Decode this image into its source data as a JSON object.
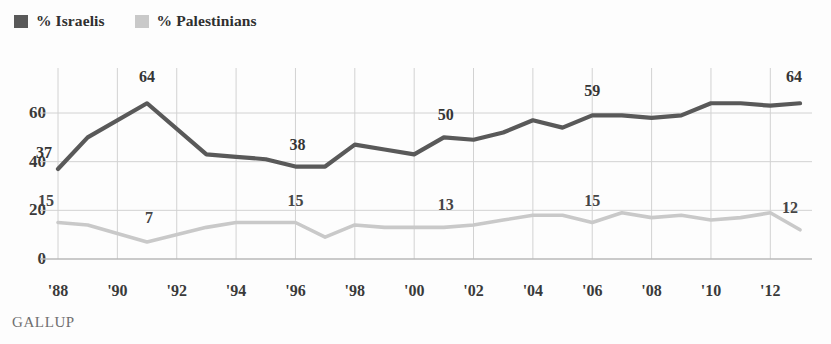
{
  "legend": {
    "items": [
      {
        "label": "% Israelis",
        "color": "#595959",
        "icon": "legend-swatch-israelis"
      },
      {
        "label": "% Palestinians",
        "color": "#c9c9c9",
        "icon": "legend-swatch-palestinians"
      }
    ]
  },
  "footer": {
    "source": "GALLUP"
  },
  "chart_data": {
    "type": "line",
    "title": "",
    "subtitle": "",
    "xlabel": "",
    "ylabel": "",
    "xlim": [
      1988,
      2013
    ],
    "ylim": [
      0,
      72
    ],
    "grid": true,
    "legend_position": "top-left",
    "y_ticks": [
      0,
      20,
      40,
      60
    ],
    "y_tick_labels": [
      "0",
      "20",
      "40",
      "60"
    ],
    "x_ticks": [
      1988,
      1990,
      1992,
      1994,
      1996,
      1998,
      2000,
      2002,
      2004,
      2006,
      2008,
      2010,
      2012
    ],
    "x_tick_labels": [
      "'88",
      "'90",
      "'92",
      "'94",
      "'96",
      "'98",
      "'00",
      "'02",
      "'04",
      "'06",
      "'08",
      "'10",
      "'12"
    ],
    "x": [
      1988,
      1989,
      1991,
      1993,
      1994,
      1995,
      1996,
      1997,
      1998,
      1999,
      2000,
      2001,
      2002,
      2003,
      2004,
      2005,
      2006,
      2007,
      2008,
      2009,
      2010,
      2011,
      2012,
      2013
    ],
    "series": [
      {
        "name": "% Israelis",
        "color": "#595959",
        "values": [
          37,
          50,
          64,
          43,
          42,
          41,
          38,
          38,
          47,
          45,
          43,
          50,
          49,
          52,
          57,
          54,
          59,
          59,
          58,
          59,
          64,
          64,
          63,
          64
        ]
      },
      {
        "name": "% Palestinians",
        "color": "#c9c9c9",
        "values": [
          15,
          14,
          7,
          13,
          15,
          15,
          15,
          9,
          14,
          13,
          13,
          13,
          14,
          16,
          18,
          18,
          15,
          19,
          17,
          18,
          16,
          17,
          19,
          12
        ]
      }
    ],
    "annotations": [
      {
        "series": "% Israelis",
        "x": 1988,
        "value": 37,
        "text": "37"
      },
      {
        "series": "% Israelis",
        "x": 1991,
        "value": 64,
        "text": "64"
      },
      {
        "series": "% Israelis",
        "x": 1996,
        "value": 38,
        "text": "38"
      },
      {
        "series": "% Israelis",
        "x": 2001,
        "value": 50,
        "text": "50"
      },
      {
        "series": "% Israelis",
        "x": 2006,
        "value": 59,
        "text": "59"
      },
      {
        "series": "% Israelis",
        "x": 2013,
        "value": 64,
        "text": "64"
      },
      {
        "series": "% Palestinians",
        "x": 1988,
        "value": 15,
        "text": "15"
      },
      {
        "series": "% Palestinians",
        "x": 1991,
        "value": 7,
        "text": "7"
      },
      {
        "series": "% Palestinians",
        "x": 1996,
        "value": 15,
        "text": "15"
      },
      {
        "series": "% Palestinians",
        "x": 2001,
        "value": 13,
        "text": "13"
      },
      {
        "series": "% Palestinians",
        "x": 2006,
        "value": 15,
        "text": "15"
      },
      {
        "series": "% Palestinians",
        "x": 2013,
        "value": 12,
        "text": "12"
      }
    ]
  }
}
